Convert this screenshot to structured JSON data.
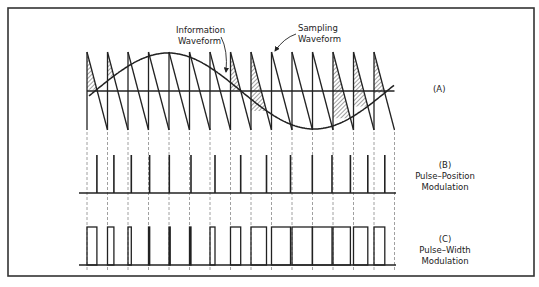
{
  "colors": {
    "background": "#ffffff",
    "ink": "#222222",
    "frame": "#333333",
    "dashed": "#888888",
    "hatch": "#444444"
  },
  "frame": {
    "x": 8,
    "y": 8,
    "width": 526,
    "height": 268
  },
  "panel_a": {
    "label": "(A)",
    "annotations": {
      "information_line1": "Information",
      "information_line2": "Waveform",
      "sampling_line1": "Sampling",
      "sampling_line2": "Waveform"
    },
    "sawtooth": {
      "x_start": 87,
      "period": 20.5,
      "periods": 15,
      "top_y": 52,
      "bottom_y": 130,
      "baseline_y": 91
    },
    "sine": {
      "x_zero": 95,
      "x_end": 394,
      "wavelength": 292,
      "amplitude": 38,
      "center_y": 91
    }
  },
  "panel_b": {
    "label": "(B)",
    "title_line1": "Pulse–Position",
    "title_line2": "Modulation",
    "baseline_y": 193,
    "pulse_top_y": 155,
    "line_x1": 79,
    "line_x2": 396
  },
  "panel_c": {
    "label": "(C)",
    "title_line1": "Pulse–Width",
    "title_line2": "Modulation",
    "baseline_y": 265,
    "pulse_top_y": 227,
    "line_x1": 79,
    "line_x2": 396
  },
  "dashed_lines": {
    "y1": 132,
    "y2": 272
  }
}
